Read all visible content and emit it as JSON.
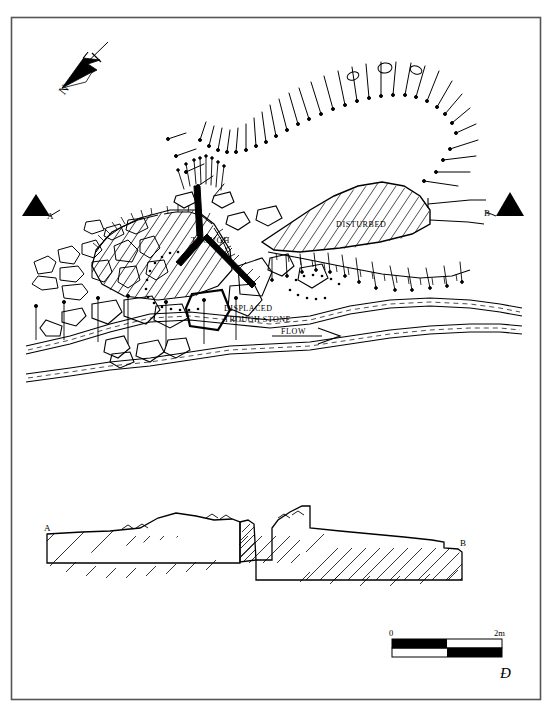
{
  "figure": {
    "kind": "archaeological-site-plan",
    "frame_color": "#555555",
    "ink_color": "#000000",
    "background": "#ffffff"
  },
  "north_arrow": {
    "label": "N"
  },
  "section_markers": {
    "left": {
      "label": "A"
    },
    "right": {
      "label": "B"
    }
  },
  "plan_labels": {
    "trough": "TROUGH",
    "disturbed": "DISTURBED",
    "displaced_line1": "DISPLACED",
    "displaced_line2": "TROUGH STONE",
    "flow": "FLOW"
  },
  "section_labels": {
    "left": "A",
    "right": "B"
  },
  "scale_bar": {
    "start_label": "0",
    "end_label": "2m",
    "segments": 4,
    "length_m": 2
  },
  "signature": {
    "monogram": "Đ"
  }
}
